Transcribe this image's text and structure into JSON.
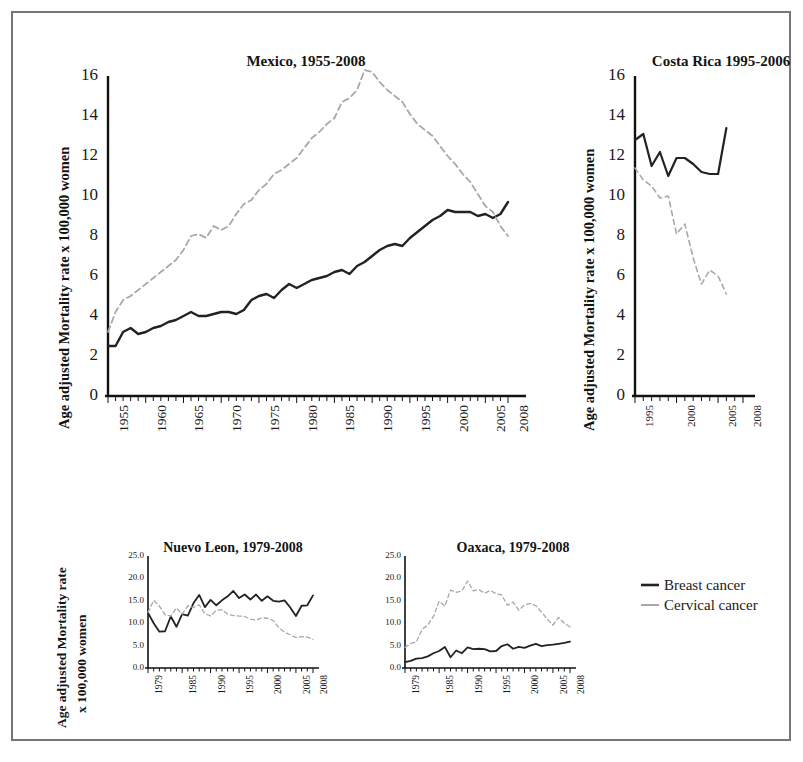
{
  "figure": {
    "background_color": "#ffffff",
    "border_color": "#767676",
    "caption_faint": ""
  },
  "legend": {
    "position": "right-middle",
    "items": [
      {
        "label": "Breast cancer",
        "style": "solid",
        "color": "#222222",
        "icon": "solid-line-swatch"
      },
      {
        "label": "Cervical cancer",
        "style": "dashed",
        "color": "#a8a8a8",
        "icon": "dashed-line-swatch"
      }
    ]
  },
  "chart_data": [
    {
      "id": "mexico",
      "type": "line",
      "title": "Mexico, 1955-2008",
      "xlabel": "",
      "ylabel": "Age adjusted Mortality rate x 100,000 women",
      "xlim": [
        1955,
        2008
      ],
      "ylim": [
        0,
        16
      ],
      "yticks": [
        "16",
        "14",
        "12",
        "10",
        "8",
        "6",
        "4",
        "2",
        "0"
      ],
      "ytick_values": [
        16,
        14,
        12,
        10,
        8,
        6,
        4,
        2,
        0
      ],
      "xticks": [
        "1955",
        "1960",
        "1965",
        "1970",
        "1975",
        "1980",
        "1985",
        "1990",
        "1995",
        "2000",
        "2005",
        "2008"
      ],
      "xtick_values": [
        1955,
        1960,
        1965,
        1970,
        1975,
        1980,
        1985,
        1990,
        1995,
        2000,
        2005,
        2008
      ],
      "grid": false,
      "x": [
        1955,
        1956,
        1957,
        1958,
        1959,
        1960,
        1961,
        1962,
        1963,
        1964,
        1965,
        1966,
        1967,
        1968,
        1969,
        1970,
        1971,
        1972,
        1973,
        1974,
        1975,
        1976,
        1977,
        1978,
        1979,
        1980,
        1981,
        1982,
        1983,
        1984,
        1985,
        1986,
        1987,
        1988,
        1989,
        1990,
        1991,
        1992,
        1993,
        1994,
        1995,
        1996,
        1997,
        1998,
        1999,
        2000,
        2001,
        2002,
        2003,
        2004,
        2005,
        2006,
        2007,
        2008
      ],
      "series": [
        {
          "name": "Breast cancer",
          "style": "solid",
          "color": "#222222",
          "values": [
            2.5,
            2.5,
            3.2,
            3.4,
            3.1,
            3.2,
            3.4,
            3.5,
            3.7,
            3.8,
            4.0,
            4.2,
            4.0,
            4.0,
            4.1,
            4.2,
            4.2,
            4.1,
            4.3,
            4.8,
            5.0,
            5.1,
            4.9,
            5.3,
            5.6,
            5.4,
            5.6,
            5.8,
            5.9,
            6.0,
            6.2,
            6.3,
            6.1,
            6.5,
            6.7,
            7.0,
            7.3,
            7.5,
            7.6,
            7.5,
            7.9,
            8.2,
            8.5,
            8.8,
            9.0,
            9.3,
            9.2,
            9.2,
            9.2,
            9.0,
            9.1,
            8.9,
            9.1,
            9.7
          ]
        },
        {
          "name": "Cervical cancer",
          "style": "dashed",
          "color": "#a8a8a8",
          "values": [
            3.2,
            4.2,
            4.8,
            5.0,
            5.3,
            5.6,
            5.9,
            6.2,
            6.5,
            6.8,
            7.3,
            8.0,
            8.1,
            7.9,
            8.5,
            8.3,
            8.5,
            9.1,
            9.6,
            9.8,
            10.3,
            10.6,
            11.1,
            11.3,
            11.6,
            11.9,
            12.4,
            12.9,
            13.2,
            13.6,
            13.9,
            14.7,
            14.9,
            15.3,
            16.3,
            16.2,
            15.7,
            15.3,
            15.0,
            14.7,
            14.1,
            13.6,
            13.3,
            13.0,
            12.5,
            12.0,
            11.6,
            11.1,
            10.7,
            10.1,
            9.5,
            9.2,
            8.5,
            8.0
          ]
        }
      ]
    },
    {
      "id": "costa-rica",
      "type": "line",
      "title": "Costa Rica 1995-2006",
      "xlabel": "",
      "ylabel": "Age adjusted Mortality rate x 100,000 women",
      "xlim": [
        1995,
        2008
      ],
      "ylim": [
        0,
        16
      ],
      "yticks": [
        "16",
        "14",
        "12",
        "10",
        "8",
        "6",
        "4",
        "2",
        "0"
      ],
      "ytick_values": [
        16,
        14,
        12,
        10,
        8,
        6,
        4,
        2,
        0
      ],
      "xticks": [
        "1995",
        "2000",
        "2005",
        "2008"
      ],
      "xtick_values": [
        1995,
        2000,
        2005,
        2008
      ],
      "grid": false,
      "x": [
        1995,
        1996,
        1997,
        1998,
        1999,
        2000,
        2001,
        2002,
        2003,
        2004,
        2005,
        2006
      ],
      "series": [
        {
          "name": "Breast cancer",
          "style": "solid",
          "color": "#222222",
          "values": [
            12.8,
            13.1,
            11.5,
            12.2,
            11.0,
            11.9,
            11.9,
            11.6,
            11.2,
            11.1,
            11.1,
            13.4
          ]
        },
        {
          "name": "Cervical cancer",
          "style": "dashed",
          "color": "#a8a8a8",
          "values": [
            11.4,
            10.8,
            10.5,
            9.9,
            10.0,
            8.1,
            8.6,
            6.9,
            5.6,
            6.3,
            6.0,
            5.1
          ]
        }
      ]
    },
    {
      "id": "nuevo-leon",
      "type": "line",
      "title": "Nuevo Leon, 1979-2008",
      "xlabel": "",
      "ylabel": "Age adjusted Mortality rate x 100,000 women",
      "ylabel_line1": "Age adjusted Mortality rate",
      "ylabel_line2": "x 100,000 women",
      "xlim": [
        1979,
        2008
      ],
      "ylim": [
        0,
        25
      ],
      "yticks": [
        "25.0",
        "20.0",
        "15.0",
        "10.0",
        "5.0",
        "0.0"
      ],
      "ytick_values": [
        25.0,
        20.0,
        15.0,
        10.0,
        5.0,
        0.0
      ],
      "xticks": [
        "1979",
        "1985",
        "1990",
        "1995",
        "2000",
        "2005",
        "2008"
      ],
      "xtick_values": [
        1979,
        1985,
        1990,
        1995,
        2000,
        2005,
        2008
      ],
      "grid": false,
      "x": [
        1979,
        1980,
        1981,
        1982,
        1983,
        1984,
        1985,
        1986,
        1987,
        1988,
        1989,
        1990,
        1991,
        1992,
        1993,
        1994,
        1995,
        1996,
        1997,
        1998,
        1999,
        2000,
        2001,
        2002,
        2003,
        2004,
        2005,
        2006,
        2007,
        2008
      ],
      "series": [
        {
          "name": "Breast cancer",
          "style": "solid",
          "color": "#222222",
          "values": [
            12.3,
            10.0,
            8.1,
            8.2,
            11.5,
            9.2,
            12.0,
            11.7,
            14.5,
            16.3,
            13.6,
            15.2,
            14.0,
            15.1,
            16.0,
            17.2,
            15.6,
            16.4,
            15.3,
            16.4,
            15.0,
            16.0,
            15.0,
            14.8,
            15.1,
            13.5,
            11.6,
            13.9,
            14.0,
            16.2
          ]
        },
        {
          "name": "Cervical cancer",
          "style": "dashed",
          "color": "#a8a8a8",
          "values": [
            12.4,
            15.1,
            13.8,
            11.9,
            11.6,
            13.4,
            12.0,
            13.9,
            13.5,
            14.1,
            12.1,
            11.6,
            12.9,
            13.0,
            12.0,
            11.7,
            11.6,
            11.5,
            10.9,
            10.7,
            11.2,
            11.1,
            10.6,
            9.0,
            8.0,
            7.4,
            6.8,
            7.0,
            6.9,
            6.4
          ]
        }
      ]
    },
    {
      "id": "oaxaca",
      "type": "line",
      "title": "Oaxaca, 1979-2008",
      "xlabel": "",
      "ylabel": "",
      "xlim": [
        1979,
        2008
      ],
      "ylim": [
        0,
        25
      ],
      "yticks": [
        "25.0",
        "20.0",
        "15.0",
        "10.0",
        "5.0",
        "0.0"
      ],
      "ytick_values": [
        25.0,
        20.0,
        15.0,
        10.0,
        5.0,
        0.0
      ],
      "xticks": [
        "1979",
        "1985",
        "1990",
        "1995",
        "2000",
        "2005",
        "2008"
      ],
      "xtick_values": [
        1979,
        1985,
        1990,
        1995,
        2000,
        2005,
        2008
      ],
      "grid": false,
      "x": [
        1979,
        1980,
        1981,
        1982,
        1983,
        1984,
        1985,
        1986,
        1987,
        1988,
        1989,
        1990,
        1991,
        1992,
        1993,
        1994,
        1995,
        1996,
        1997,
        1998,
        1999,
        2000,
        2001,
        2002,
        2003,
        2004,
        2005,
        2006,
        2007,
        2008
      ],
      "series": [
        {
          "name": "Breast cancer",
          "style": "solid",
          "color": "#222222",
          "values": [
            1.3,
            1.6,
            2.1,
            2.2,
            2.6,
            3.3,
            3.8,
            4.7,
            2.4,
            3.9,
            3.3,
            4.6,
            4.2,
            4.3,
            4.2,
            3.7,
            3.8,
            4.9,
            5.3,
            4.3,
            4.7,
            4.5,
            5.0,
            5.4,
            4.9,
            5.1,
            5.2,
            5.4,
            5.6,
            5.9
          ]
        },
        {
          "name": "Cervical cancer",
          "style": "dashed",
          "color": "#a8a8a8",
          "values": [
            4.6,
            5.5,
            5.8,
            8.6,
            9.6,
            11.5,
            14.9,
            13.8,
            17.4,
            16.9,
            17.2,
            19.4,
            17.2,
            17.5,
            16.7,
            17.3,
            16.6,
            16.3,
            14.0,
            14.7,
            12.9,
            14.1,
            14.4,
            13.9,
            12.5,
            10.9,
            9.6,
            11.3,
            10.0,
            9.2
          ]
        }
      ]
    }
  ]
}
